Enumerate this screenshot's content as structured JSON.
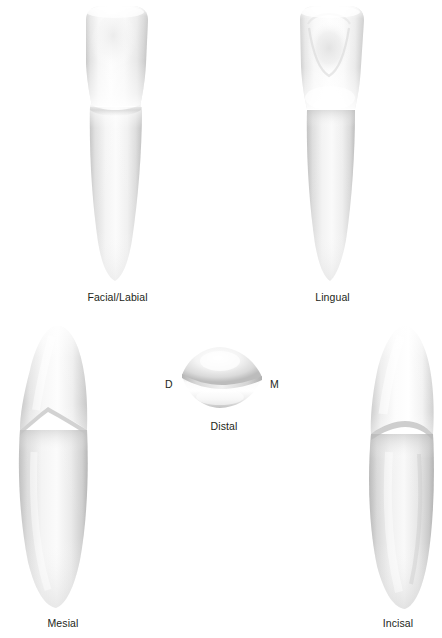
{
  "figure": {
    "background_color": "#ffffff",
    "ink_color": "#231f20",
    "views": [
      {
        "key": "facial",
        "label": "Facial/Labial",
        "position": "top-left"
      },
      {
        "key": "lingual",
        "label": "Lingual",
        "position": "top-right"
      },
      {
        "key": "mesial",
        "label": "Mesial",
        "position": "bottom-left"
      },
      {
        "key": "incisal",
        "label": "Incisal",
        "position": "center"
      },
      {
        "key": "distal",
        "label": "Distal",
        "position": "bottom-right"
      }
    ],
    "orientation_markers": [
      {
        "key": "distal-axis",
        "label": "D",
        "side": "left"
      },
      {
        "key": "mesial-axis",
        "label": "M",
        "side": "right"
      }
    ]
  }
}
